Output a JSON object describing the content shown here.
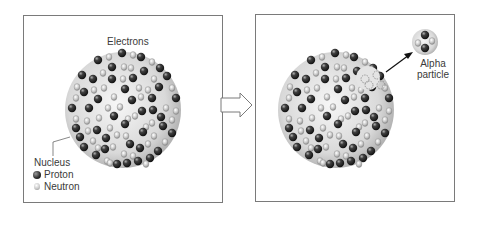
{
  "diagram": {
    "type": "alpha-decay-illustration",
    "panels": [
      {
        "id": "before",
        "labels": {
          "electrons": "Electrons",
          "nucleus": "Nucleus"
        },
        "legend": [
          {
            "symbol": "proton-icon",
            "label": "Proton",
            "color": "#2a2a2a"
          },
          {
            "symbol": "neutron-icon",
            "label": "Neutron",
            "color": "#d0d0d0"
          }
        ]
      },
      {
        "id": "after",
        "labels": {
          "alpha_line1": "Alpha",
          "alpha_line2": "particle"
        }
      }
    ],
    "transition_arrow": "hollow-right-arrow",
    "colors": {
      "border": "#7a7a7a",
      "nucleus_fill": "#d8d8d8",
      "proton": "#2a2a2a",
      "neutron": "#cfcfcf",
      "text": "#3a3a3a"
    }
  }
}
